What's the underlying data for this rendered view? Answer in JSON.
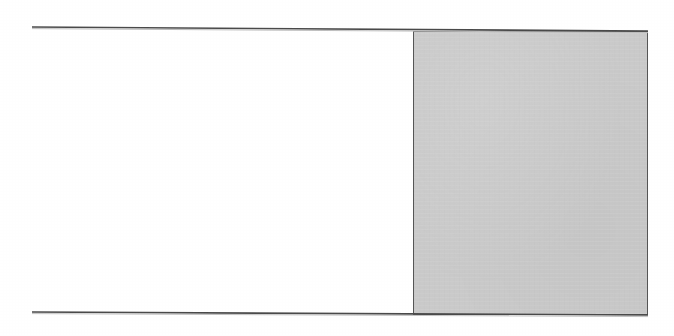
{
  "page": {
    "kind": "scanned-figure-fragment",
    "width": 674,
    "height": 336,
    "background_color": "#ffffff",
    "caption": "",
    "title": ""
  },
  "figure": {
    "name": "ruled-frame-with-shaded-block",
    "description": "",
    "rules": [
      {
        "name": "top-rule",
        "x1": 32,
        "y1": 27,
        "x2": 648,
        "y2": 31,
        "color": "#4a4a4a",
        "thickness": 1.6,
        "label": ""
      },
      {
        "name": "bottom-rule",
        "x1": 32,
        "y1": 312,
        "x2": 648,
        "y2": 315,
        "color": "#4a4a4a",
        "thickness": 1.6,
        "label": ""
      }
    ],
    "shaded_block": {
      "name": "shaded-column",
      "x": 413,
      "y": 31,
      "width": 235,
      "height": 284,
      "fill_color": "#cacaca",
      "border_color": "#565656",
      "border_width": 1.5,
      "label": ""
    },
    "white_region": {
      "name": "blank-column",
      "x": 32,
      "y": 29,
      "width": 381,
      "height": 285,
      "fill_color": "#ffffff",
      "label": ""
    }
  },
  "annotations": {
    "items": []
  }
}
